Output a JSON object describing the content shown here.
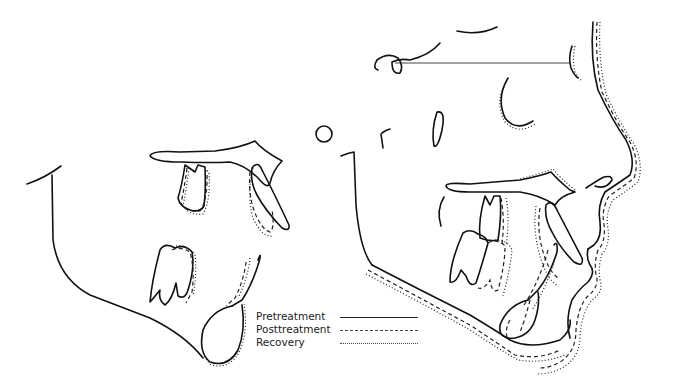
{
  "figure": {
    "panels": [
      {
        "name": "left-partial-tracing",
        "structures": [
          "mandible outline",
          "palatal plane",
          "upper molar",
          "upper incisor",
          "lower molar",
          "lower incisor",
          "symphysis"
        ]
      },
      {
        "name": "right-profile-tracing",
        "structures": [
          "sella",
          "nasion line",
          "orbit",
          "porion",
          "pterygomaxillary fissure",
          "soft tissue profile",
          "maxilla",
          "mandible",
          "teeth"
        ]
      }
    ]
  },
  "legend": {
    "items": [
      {
        "label": "Pretreatment",
        "style": "solid"
      },
      {
        "label": "Posttreatment",
        "style": "dashed"
      },
      {
        "label": "Recovery",
        "style": "dotted"
      }
    ]
  },
  "colors": {
    "line": "#111111",
    "background": "#ffffff"
  }
}
